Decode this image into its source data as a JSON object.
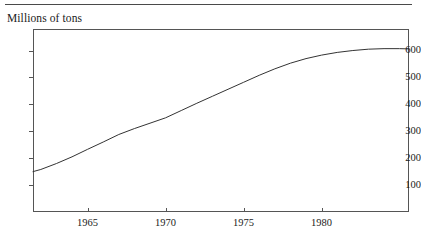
{
  "figure": {
    "caption": "Millions of tons",
    "line_color": "#333333",
    "axis_color": "#555555",
    "rule_color": "#4a4a4a",
    "background": "#ffffff"
  },
  "chart_data": {
    "type": "line",
    "title": "",
    "subtitle": "",
    "xlabel": "",
    "ylabel": "Millions of tons",
    "grid": false,
    "legend": null,
    "xlim": [
      1961.5,
      1985.6
    ],
    "ylim": [
      0,
      680
    ],
    "xticks": [
      1965,
      1970,
      1975,
      1980
    ],
    "xticklabels": [
      "1965",
      "1970",
      "1975",
      "1980"
    ],
    "yticks": [
      100,
      200,
      300,
      400,
      500,
      600
    ],
    "yticklabels": [
      "100",
      "200",
      "300",
      "400",
      "500",
      "600"
    ],
    "series": [
      {
        "name": "Millions of tons",
        "x": [
          1961.5,
          1962,
          1963,
          1964,
          1965,
          1966,
          1967,
          1968,
          1969,
          1970,
          1971,
          1972,
          1973,
          1974,
          1975,
          1976,
          1977,
          1978,
          1979,
          1980,
          1981,
          1982,
          1983,
          1984,
          1985,
          1985.6
        ],
        "values": [
          150,
          158,
          180,
          205,
          233,
          260,
          288,
          310,
          330,
          350,
          377,
          404,
          430,
          456,
          482,
          508,
          532,
          553,
          570,
          583,
          593,
          600,
          605,
          607,
          607,
          606
        ]
      }
    ]
  }
}
